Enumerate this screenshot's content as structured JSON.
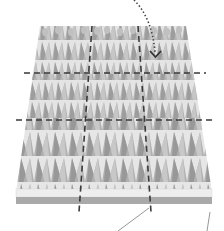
{
  "diagram": {
    "colors": {
      "background": "#ffffff",
      "spike_dark": "#9a9a9a",
      "spike_mid": "#b5b5b5",
      "spike_light": "#cfcfcf",
      "spike_tip": "#bdbdbd",
      "surface": "#e6e6e6",
      "base_top": "#ececec",
      "base_side": "#a8a8a8",
      "dashed_line": "#3a3a3a",
      "arrow": "#444444",
      "leader_line": "#8a8a8a"
    },
    "grid": {
      "horizontal_dashes": 2,
      "vertical_dashes": 2
    },
    "arrow": {
      "style": "dotted",
      "icon": "chevron-down"
    },
    "leader_lines": 2
  }
}
